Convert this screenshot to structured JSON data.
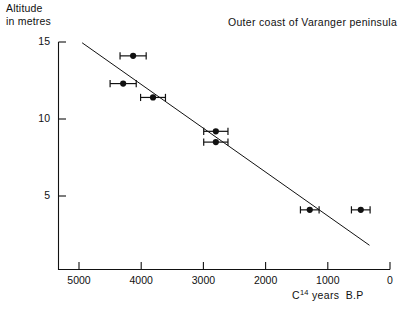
{
  "chart_data": {
    "type": "scatter",
    "title": "Outer coast of Varanger peninsula",
    "xlabel": "C14 years B.P",
    "xlabel_base": "C",
    "xlabel_sup": "14",
    "xlabel_rest": "years  B.P",
    "ylabel": "Altitude in metres",
    "ylabel_line1": "Altitude",
    "ylabel_line2": "in metres",
    "xlim": [
      5500,
      0
    ],
    "ylim": [
      0,
      15.8
    ],
    "x_reversed": true,
    "grid": false,
    "legend": null,
    "xticks": [
      5000,
      4000,
      3000,
      2000,
      1000,
      0
    ],
    "xtick_labels": [
      "5000",
      "4000",
      "3000",
      "2000",
      "1000",
      "0"
    ],
    "yticks": [
      5,
      10,
      15
    ],
    "ytick_labels": [
      "5",
      "10",
      "15"
    ],
    "points": [
      {
        "x": 4130,
        "y": 14.1,
        "xerr": 210
      },
      {
        "x": 4290,
        "y": 12.3,
        "xerr": 210
      },
      {
        "x": 3810,
        "y": 11.4,
        "xerr": 200
      },
      {
        "x": 2800,
        "y": 9.2,
        "xerr": 195
      },
      {
        "x": 2800,
        "y": 8.5,
        "xerr": 195
      },
      {
        "x": 1290,
        "y": 4.1,
        "xerr": 150
      },
      {
        "x": 470,
        "y": 4.1,
        "xerr": 150
      }
    ],
    "trend_line": {
      "x_start": 4950,
      "y_start": 14.95,
      "x_end": 330,
      "y_end": 1.8
    }
  }
}
